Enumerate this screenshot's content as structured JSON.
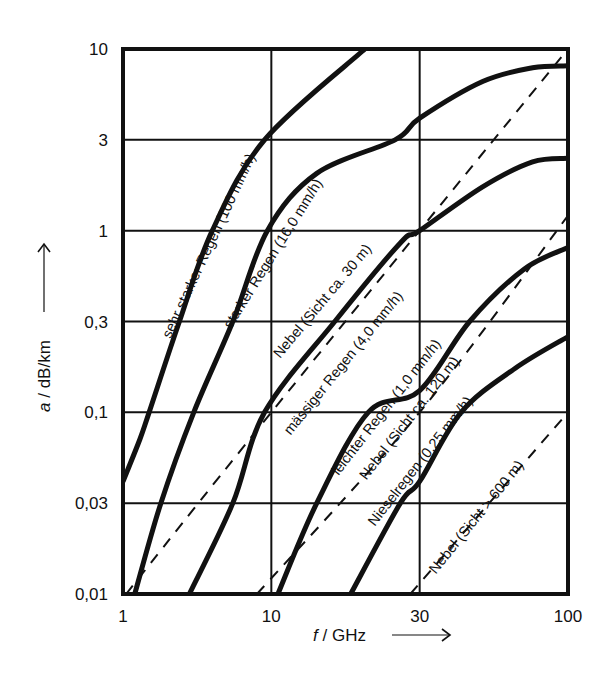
{
  "chart_data": {
    "type": "line",
    "title": "",
    "xlabel": "f / GHz",
    "ylabel": "a / dB/km",
    "x_scale": "nonlinear (evenly spaced ticks 1, 10, 30, 100)",
    "y_scale": "nonlinear (evenly spaced ticks 0.01 ... 10)",
    "xlim": [
      1,
      100
    ],
    "ylim": [
      0.01,
      10
    ],
    "x_ticks": [
      1,
      10,
      30,
      100
    ],
    "x_tick_labels": [
      "1",
      "10",
      "30",
      "100"
    ],
    "y_ticks": [
      0.01,
      0.03,
      0.1,
      0.3,
      1,
      3,
      10
    ],
    "y_tick_labels": [
      "0,01",
      "0,03",
      "0,1",
      "0,3",
      "1",
      "3",
      "10"
    ],
    "grid": true,
    "legend": "none (labels inline along curves)",
    "series": [
      {
        "name": "sehr starker Regen (100 mm/h)",
        "style": "solid",
        "points": [
          [
            1,
            0.04
          ],
          [
            1.3,
            0.07
          ],
          [
            1.5,
            0.1
          ],
          [
            2.4,
            0.3
          ],
          [
            4,
            1
          ],
          [
            9,
            3
          ],
          [
            20,
            10
          ]
        ]
      },
      {
        "name": "starker Regen (16,0 mm/h)",
        "style": "solid",
        "points": [
          [
            1.2,
            0.01
          ],
          [
            1.8,
            0.03
          ],
          [
            3,
            0.1
          ],
          [
            5.5,
            0.3
          ],
          [
            9.4,
            1
          ],
          [
            14,
            2
          ],
          [
            25,
            3
          ],
          [
            30,
            4
          ],
          [
            50,
            6.5
          ],
          [
            75,
            7.8
          ],
          [
            100,
            8
          ]
        ]
      },
      {
        "name": "Nebel (Sicht ca. 30 m)",
        "style": "dashed",
        "points": [
          [
            1.05,
            0.01
          ],
          [
            10,
            0.1
          ],
          [
            100,
            10
          ]
        ]
      },
      {
        "name": "mässiger Regen (4,0 mm/h)",
        "style": "solid",
        "points": [
          [
            2.8,
            0.01
          ],
          [
            5.5,
            0.03
          ],
          [
            9,
            0.1
          ],
          [
            16,
            0.3
          ],
          [
            26,
            0.85
          ],
          [
            30,
            1
          ],
          [
            50,
            1.7
          ],
          [
            75,
            2.3
          ],
          [
            100,
            2.4
          ]
        ]
      },
      {
        "name": "leichter Regen (1,0 mm/h)",
        "style": "solid",
        "points": [
          [
            10.5,
            0.01
          ],
          [
            14,
            0.03
          ],
          [
            20.5,
            0.1
          ],
          [
            30,
            0.13
          ],
          [
            45,
            0.3
          ],
          [
            70,
            0.6
          ],
          [
            100,
            0.8
          ]
        ]
      },
      {
        "name": "Nebel (Sicht ca. 120 m)",
        "style": "dashed",
        "points": [
          [
            8,
            0.01
          ],
          [
            30,
            0.1
          ],
          [
            100,
            1.2
          ]
        ]
      },
      {
        "name": "Nieselregen (0,25 mm/h)",
        "style": "solid",
        "points": [
          [
            18,
            0.01
          ],
          [
            26,
            0.03
          ],
          [
            30,
            0.04
          ],
          [
            42,
            0.1
          ],
          [
            65,
            0.17
          ],
          [
            100,
            0.25
          ]
        ]
      },
      {
        "name": "Nebel (Sicht > 600 m)",
        "style": "dashed",
        "points": [
          [
            28,
            0.01
          ],
          [
            100,
            0.1
          ]
        ]
      }
    ],
    "annotations": [
      {
        "text": "sehr starker Regen (100 mm/h)",
        "x_px": 213,
        "y_px": 248,
        "angle": -65
      },
      {
        "text": "starker Regen (16,0 mm/h)",
        "x_px": 277,
        "y_px": 256,
        "angle": -58
      },
      {
        "text": "Nebel (Sicht ca. 30 m)",
        "x_px": 326,
        "y_px": 304,
        "angle": -50
      },
      {
        "text": "mässiger Regen (4,0 mm/h)",
        "x_px": 347,
        "y_px": 366,
        "angle": -51
      },
      {
        "text": "leichter Regen (1,0 mm/h)",
        "x_px": 390,
        "y_px": 410,
        "angle": -52
      },
      {
        "text": "Nebel (Sicht ca. 120 m)",
        "x_px": 413,
        "y_px": 421,
        "angle": -52
      },
      {
        "text": "Nieselregen (0,25 mm/h)",
        "x_px": 424,
        "y_px": 464,
        "angle": -52
      },
      {
        "text": "Nebel (Sicht > 600 m)",
        "x_px": 480,
        "y_px": 520,
        "angle": -51
      }
    ]
  },
  "labels": {
    "x_axis": "f / GHz",
    "y_axis": "a / dB/km",
    "y_axis_italic": "a",
    "y_axis_rest": " / dB/km",
    "x_axis_italic": "f",
    "x_axis_rest": " / GHz"
  },
  "colors": {
    "line": "#111111",
    "grid": "#111111",
    "background": "#ffffff"
  }
}
